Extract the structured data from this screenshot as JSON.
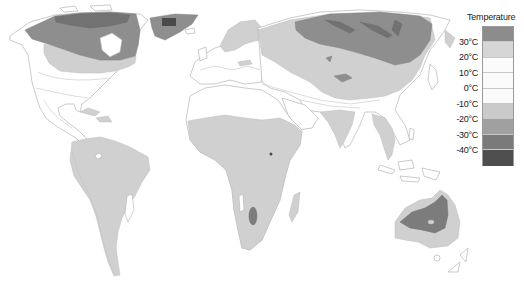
{
  "legend": {
    "title": "Temperature",
    "labels": [
      "30°C",
      "20°C",
      "10°C",
      "0°C",
      "-10°C",
      "-20°C",
      "-30°C",
      "-40°C"
    ],
    "bands": [
      {
        "color": "#8c8c8c"
      },
      {
        "color": "#d6d6d6"
      },
      {
        "color": "#fbfbfb"
      },
      {
        "color": "#fbfbfb"
      },
      {
        "color": "#fbfbfb"
      },
      {
        "color": "#cacaca"
      },
      {
        "color": "#a0a0a0"
      },
      {
        "color": "#7a7a7a"
      },
      {
        "color": "#4e4e4e"
      }
    ]
  },
  "map": {
    "type": "world temperature choropleth (grayscale)",
    "background": "#ffffff"
  }
}
